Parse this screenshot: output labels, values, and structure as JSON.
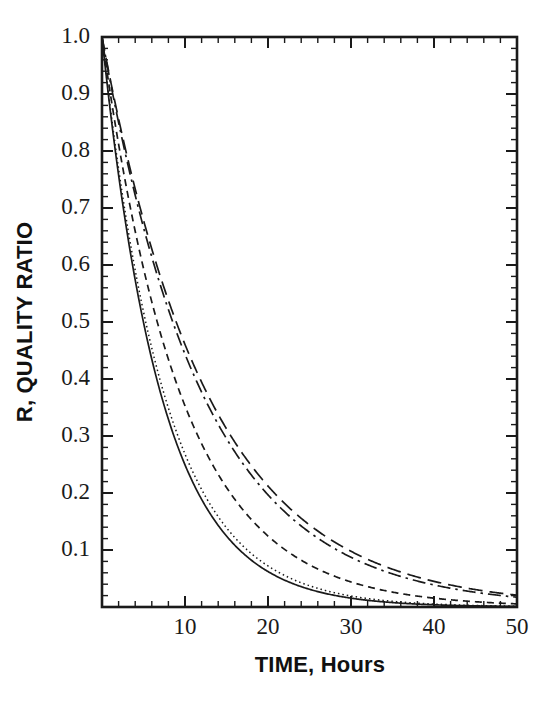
{
  "figure": {
    "background_color": "#ffffff",
    "ink_color": "#1a1a1a"
  },
  "chart_data": {
    "type": "line",
    "title": "",
    "subtitle": "",
    "xlabel": "TIME, Hours",
    "ylabel": "R, QUALITY RATIO",
    "xlim": [
      0,
      50
    ],
    "ylim": [
      0,
      1.0
    ],
    "grid": false,
    "legend_position": "none",
    "annotations": [],
    "x_axis": {
      "label": "TIME, Hours",
      "tick_labels": [
        "10",
        "20",
        "30",
        "40",
        "50"
      ],
      "tick_values": [
        10,
        20,
        30,
        40,
        50
      ],
      "minor_tick_step": 2,
      "scale": "linear",
      "range": [
        0,
        50
      ],
      "units": "Hours"
    },
    "y_axis": {
      "label": "R, QUALITY RATIO",
      "tick_labels": [
        "1.0",
        "0.9",
        "0.8",
        "0.7",
        "0.6",
        "0.5",
        "0.4",
        "0.3",
        "0.2",
        "0.1"
      ],
      "tick_values": [
        1.0,
        0.9,
        0.8,
        0.7,
        0.6,
        0.5,
        0.4,
        0.3,
        0.2,
        0.1
      ],
      "minor_tick_step": 0.02,
      "scale": "linear",
      "range": [
        0,
        1.0
      ]
    },
    "x": [
      0,
      1,
      2,
      3,
      4,
      5,
      6,
      7,
      8,
      9,
      10,
      12,
      14,
      16,
      18,
      20,
      22,
      24,
      26,
      28,
      30,
      32,
      34,
      36,
      38,
      40,
      42,
      44,
      46,
      48,
      50
    ],
    "series": [
      {
        "name": "curve-1-solid",
        "line_style": "solid",
        "time_constant_hours": 7.2,
        "values": [
          1.0,
          0.871,
          0.758,
          0.66,
          0.574,
          0.5,
          0.435,
          0.379,
          0.33,
          0.287,
          0.25,
          0.189,
          0.143,
          0.108,
          0.082,
          0.062,
          0.047,
          0.035,
          0.027,
          0.02,
          0.015,
          0.012,
          0.009,
          0.007,
          0.005,
          0.004,
          0.003,
          0.002,
          0.0017,
          0.0013,
          0.001
        ]
      },
      {
        "name": "curve-2-dotted",
        "line_style": "dotted",
        "time_constant_hours": 7.6,
        "values": [
          1.0,
          0.877,
          0.77,
          0.675,
          0.592,
          0.52,
          0.456,
          0.4,
          0.351,
          0.308,
          0.27,
          0.208,
          0.16,
          0.123,
          0.095,
          0.073,
          0.056,
          0.043,
          0.033,
          0.026,
          0.02,
          0.015,
          0.012,
          0.009,
          0.007,
          0.005,
          0.004,
          0.003,
          0.0024,
          0.0019,
          0.0014
        ]
      },
      {
        "name": "curve-3-dashed",
        "line_style": "dashed",
        "time_constant_hours": 9.6,
        "values": [
          1.0,
          0.901,
          0.812,
          0.732,
          0.659,
          0.594,
          0.535,
          0.482,
          0.435,
          0.392,
          0.353,
          0.287,
          0.233,
          0.189,
          0.154,
          0.125,
          0.101,
          0.082,
          0.067,
          0.054,
          0.044,
          0.036,
          0.029,
          0.023,
          0.019,
          0.015,
          0.012,
          0.01,
          0.008,
          0.0066,
          0.0053
        ]
      },
      {
        "name": "curve-4-dashdot",
        "line_style": "dash-dot",
        "time_constant_hours": 12.3,
        "values": [
          1.0,
          0.922,
          0.85,
          0.784,
          0.723,
          0.666,
          0.614,
          0.566,
          0.522,
          0.481,
          0.444,
          0.377,
          0.321,
          0.272,
          0.231,
          0.197,
          0.167,
          0.142,
          0.121,
          0.103,
          0.087,
          0.074,
          0.063,
          0.053,
          0.045,
          0.039,
          0.033,
          0.028,
          0.024,
          0.02,
          0.017
        ]
      },
      {
        "name": "curve-5-longdash",
        "line_style": "long-dash",
        "time_constant_hours": 12.9,
        "values": [
          1.0,
          0.925,
          0.856,
          0.792,
          0.733,
          0.678,
          0.628,
          0.581,
          0.538,
          0.498,
          0.461,
          0.394,
          0.338,
          0.289,
          0.248,
          0.212,
          0.182,
          0.156,
          0.133,
          0.114,
          0.098,
          0.084,
          0.072,
          0.061,
          0.053,
          0.045,
          0.038,
          0.033,
          0.028,
          0.024,
          0.021
        ]
      }
    ]
  },
  "plot_geometry": {
    "left_px": 102,
    "right_px": 517,
    "top_px": 37,
    "bottom_px": 607
  }
}
